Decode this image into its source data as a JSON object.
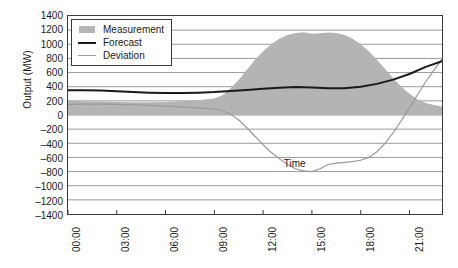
{
  "chart_data": {
    "type": "area",
    "title": "",
    "xlabel": "Time",
    "ylabel": "Output (MW)",
    "ylim": [
      -1400,
      1400
    ],
    "ytick_step": 200,
    "yticks": [
      "1400",
      "1200",
      "1000",
      "800",
      "600",
      "400",
      "200",
      "0",
      "-200",
      "-400",
      "-600",
      "-800",
      "-1000",
      "-1200",
      "-1400"
    ],
    "xticks": [
      "00:00",
      "03:00",
      "06:00",
      "09:00",
      "12:00",
      "15:00",
      "18:00",
      "21:00"
    ],
    "xlim_hours": [
      0,
      23
    ],
    "grid": "horizontal",
    "legend_position": "top-left",
    "colors": {
      "measurement_fill": "#b4b4b4",
      "forecast_line": "#1a1a1a",
      "deviation_line": "#9a9a9a",
      "grid": "#9b9b9b",
      "axis": "#3a3a3a",
      "background": "#ffffff"
    },
    "annotations": [
      {
        "text": "Time",
        "x_hours": 13.2,
        "y_value": -690
      }
    ],
    "series": [
      {
        "name": "Measurement",
        "render": "area",
        "x_hours": [
          0,
          1,
          2,
          3,
          4,
          5,
          6,
          7,
          8,
          9,
          9.5,
          10,
          10.5,
          11,
          11.5,
          12,
          12.5,
          13,
          13.5,
          14,
          14.5,
          15,
          15.5,
          16,
          16.5,
          17,
          17.5,
          18,
          18.5,
          19,
          19.5,
          20,
          20.5,
          21,
          21.5,
          22,
          22.5,
          23
        ],
        "values": [
          200,
          195,
          190,
          185,
          180,
          180,
          185,
          195,
          210,
          235,
          280,
          380,
          500,
          640,
          780,
          900,
          1000,
          1080,
          1130,
          1160,
          1170,
          1150,
          1155,
          1165,
          1160,
          1130,
          1080,
          1000,
          900,
          780,
          650,
          520,
          400,
          300,
          220,
          170,
          140,
          120
        ]
      },
      {
        "name": "Forecast",
        "render": "line",
        "x_hours": [
          0,
          1,
          2,
          3,
          4,
          5,
          6,
          7,
          8,
          9,
          10,
          11,
          12,
          13,
          14,
          15,
          16,
          17,
          18,
          19,
          20,
          21,
          22,
          23
        ],
        "values": [
          350,
          350,
          345,
          335,
          325,
          315,
          310,
          310,
          315,
          325,
          340,
          355,
          370,
          385,
          395,
          390,
          380,
          380,
          400,
          440,
          500,
          580,
          680,
          760
        ]
      },
      {
        "name": "Deviation",
        "render": "line",
        "x_hours": [
          0,
          1,
          2,
          3,
          4,
          5,
          6,
          7,
          8,
          9,
          9.5,
          10,
          10.5,
          11,
          11.5,
          12,
          12.5,
          13,
          13.5,
          14,
          14.5,
          15,
          15.5,
          16,
          16.5,
          17,
          17.5,
          18,
          18.5,
          19,
          19.5,
          20,
          20.5,
          21,
          21.5,
          22,
          22.5,
          23
        ],
        "values": [
          150,
          155,
          155,
          150,
          145,
          135,
          125,
          115,
          100,
          85,
          60,
          10,
          -70,
          -180,
          -300,
          -420,
          -530,
          -620,
          -700,
          -760,
          -790,
          -800,
          -760,
          -700,
          -680,
          -670,
          -660,
          -640,
          -600,
          -520,
          -400,
          -250,
          -80,
          100,
          290,
          470,
          630,
          790
        ]
      }
    ]
  },
  "legend": {
    "items": [
      {
        "label": "Measurement",
        "key": "area-swatch"
      },
      {
        "label": "Forecast",
        "key": "line-swatch"
      },
      {
        "label": "Deviation",
        "key": "line-swatch-gray"
      }
    ]
  },
  "axes": {
    "y_title": "Output (MW)",
    "x_title_annotation": "Time"
  }
}
